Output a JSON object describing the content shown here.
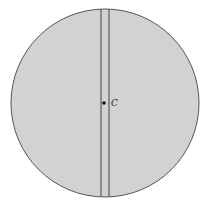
{
  "diagram": {
    "disk": {
      "cx": 105,
      "cy": 103,
      "r": 94,
      "fill": "#d2d2d2",
      "stroke": "#555555"
    },
    "slot": {
      "x1": 101,
      "x2": 109,
      "stroke": "#444444"
    },
    "center_point": {
      "cx": 104,
      "cy": 103,
      "label": "C"
    }
  }
}
